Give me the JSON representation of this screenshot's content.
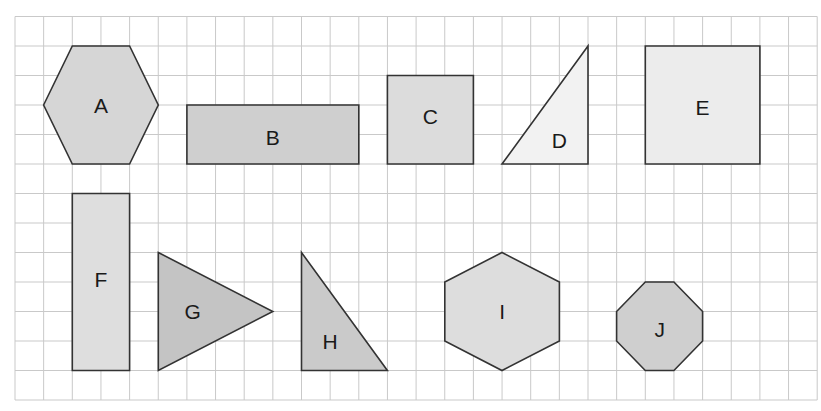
{
  "title": {
    "text": "",
    "note": "title text is cropped off; only descender fragments visible"
  },
  "grid": {
    "origin_x": 15,
    "origin_y": 16.5,
    "cell_w": 28.65,
    "cell_h": 29.5,
    "cols": 28,
    "rows": 13,
    "line_color": "#c9c9c9",
    "background": "#ffffff"
  },
  "style": {
    "stroke": "#333333",
    "stroke_width": 1.6
  },
  "shapes": [
    {
      "id": "A",
      "label": "A",
      "type": "hexagon",
      "fill": "#d6d6d6",
      "points": [
        [
          1,
          3
        ],
        [
          2,
          1
        ],
        [
          4,
          1
        ],
        [
          5,
          3
        ],
        [
          4,
          5
        ],
        [
          2,
          5
        ]
      ],
      "label_pos": [
        3,
        3
      ]
    },
    {
      "id": "B",
      "label": "B",
      "type": "rectangle",
      "fill": "#cfcfcf",
      "points": [
        [
          6,
          3
        ],
        [
          12,
          3
        ],
        [
          12,
          5
        ],
        [
          6,
          5
        ]
      ],
      "label_pos": [
        9,
        4.1
      ]
    },
    {
      "id": "C",
      "label": "C",
      "type": "square",
      "fill": "#dcdcdc",
      "points": [
        [
          13,
          2
        ],
        [
          16,
          2
        ],
        [
          16,
          5
        ],
        [
          13,
          5
        ]
      ],
      "label_pos": [
        14.5,
        3.4
      ]
    },
    {
      "id": "D",
      "label": "D",
      "type": "right-triangle",
      "fill": "#f2f2f2",
      "points": [
        [
          17,
          5
        ],
        [
          20,
          1
        ],
        [
          20,
          5
        ]
      ],
      "label_pos": [
        19,
        4.2
      ]
    },
    {
      "id": "E",
      "label": "E",
      "type": "square",
      "fill": "#ececec",
      "points": [
        [
          22,
          1
        ],
        [
          26,
          1
        ],
        [
          26,
          5
        ],
        [
          22,
          5
        ]
      ],
      "label_pos": [
        24,
        3.1
      ]
    },
    {
      "id": "F",
      "label": "F",
      "type": "rectangle",
      "fill": "#dedede",
      "points": [
        [
          2,
          6
        ],
        [
          4,
          6
        ],
        [
          4,
          12
        ],
        [
          2,
          12
        ]
      ],
      "label_pos": [
        3,
        8.9
      ]
    },
    {
      "id": "G",
      "label": "G",
      "type": "isosceles-triangle",
      "fill": "#c4c4c4",
      "points": [
        [
          5,
          8
        ],
        [
          9,
          10
        ],
        [
          5,
          12
        ]
      ],
      "label_pos": [
        6.2,
        10
      ]
    },
    {
      "id": "H",
      "label": "H",
      "type": "right-triangle",
      "fill": "#cacaca",
      "points": [
        [
          10,
          8
        ],
        [
          10,
          12
        ],
        [
          13,
          12
        ]
      ],
      "label_pos": [
        11,
        11
      ]
    },
    {
      "id": "I",
      "label": "I",
      "type": "hexagon",
      "fill": "#dddddd",
      "points": [
        [
          17,
          8
        ],
        [
          19,
          9
        ],
        [
          19,
          11
        ],
        [
          17,
          12
        ],
        [
          15,
          11
        ],
        [
          15,
          9
        ]
      ],
      "label_pos": [
        17,
        10
      ]
    },
    {
      "id": "J",
      "label": "J",
      "type": "octagon",
      "fill": "#cfcfcf",
      "points": [
        [
          22,
          9
        ],
        [
          23,
          9
        ],
        [
          24,
          10
        ],
        [
          24,
          11
        ],
        [
          23,
          12
        ],
        [
          22,
          12
        ],
        [
          21,
          11
        ],
        [
          21,
          10
        ]
      ],
      "label_pos": [
        22.5,
        10.6
      ]
    }
  ]
}
